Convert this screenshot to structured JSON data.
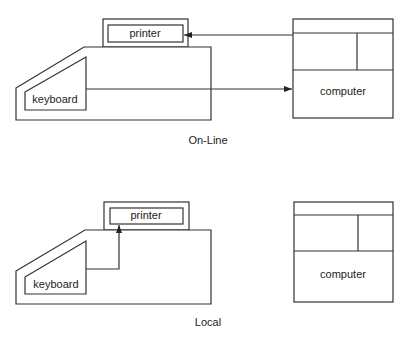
{
  "diagrams": [
    {
      "caption": "On-Line",
      "printer_label": "printer",
      "keyboard_label": "keyboard",
      "computer_label": "computer"
    },
    {
      "caption": "Local",
      "printer_label": "printer",
      "keyboard_label": "keyboard",
      "computer_label": "computer"
    }
  ],
  "colors": {
    "line": "#333333",
    "background": "#ffffff"
  }
}
